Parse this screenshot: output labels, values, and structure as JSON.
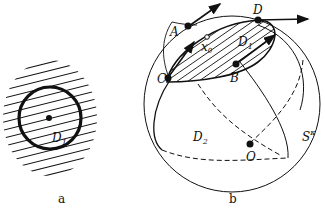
{
  "figure_a": {
    "caption": "a",
    "region_label": "D",
    "region_sub": "1"
  },
  "figure_b": {
    "caption": "b",
    "points": {
      "A": "A",
      "B": "B",
      "C": "C",
      "D": "D",
      "O": "O",
      "x0": "x",
      "x0_sub": "0"
    },
    "regions": {
      "D1": "D",
      "D1_sub": "1",
      "D2": "D",
      "D2_sub": "2"
    },
    "sphere_label": "S",
    "sphere_sup": "κ"
  },
  "colors": {
    "ink": "#111111",
    "background": "#ffffff"
  }
}
